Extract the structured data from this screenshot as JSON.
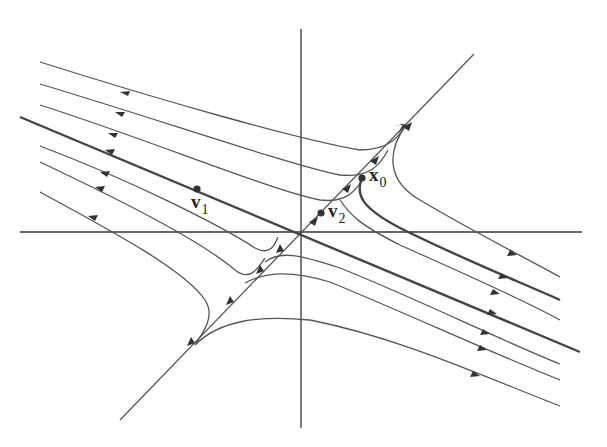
{
  "diagram": {
    "type": "phase-portrait-saddle",
    "labels": {
      "v1": {
        "base": "v",
        "sub": "1"
      },
      "v2": {
        "base": "v",
        "sub": "2"
      },
      "x0": {
        "base": "x",
        "sub": "0"
      }
    },
    "colors": {
      "line": "#555555",
      "thick": "#444444",
      "axis": "#333333",
      "background": "#ffffff"
    }
  }
}
